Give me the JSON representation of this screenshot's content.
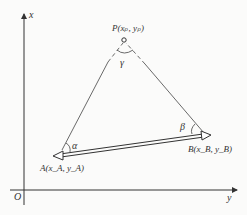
{
  "diagram": {
    "axes": {
      "vertical_label": "x",
      "horizontal_label": "y",
      "origin_label": "O"
    },
    "points": {
      "P": {
        "label": "P(x_P, y_P)",
        "text": "P(xₚ,  yₚ)"
      },
      "A": {
        "label": "A(x_A, y_A)",
        "text": "A(x_A,  y_A)"
      },
      "B": {
        "label": "B(x_B, y_B)",
        "text": "B(x_B,  y_B)"
      }
    },
    "angles": {
      "alpha": "α",
      "beta": "β",
      "gamma": "γ"
    },
    "colors": {
      "line": "#333333",
      "background": "#fbfbfa"
    }
  }
}
